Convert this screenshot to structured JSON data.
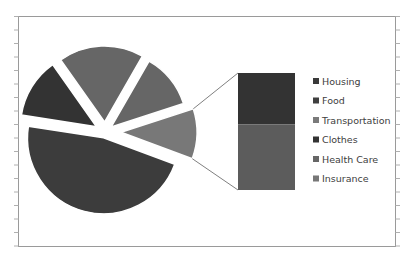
{
  "chart_data": {
    "type": "pie",
    "subtype": "bar-of-pie",
    "title": "",
    "legend_position": "right",
    "legend": [
      "Housing",
      "Food",
      "Transportation",
      "Clothes",
      "Health Care",
      "Insurance"
    ],
    "pie_slices": [
      {
        "label": "Other",
        "value": 10,
        "color": "#787878",
        "members": [
          "Health Care",
          "Insurance"
        ]
      },
      {
        "label": "Housing",
        "value": 44,
        "color": "#3c3c3c"
      },
      {
        "label": "Food",
        "value": 12,
        "color": "#333333"
      },
      {
        "label": "Transportation",
        "value": 17,
        "color": "#666666"
      },
      {
        "label": "Clothes",
        "value": 11,
        "color": "#666666"
      }
    ],
    "bar_segments": [
      {
        "label": "Health Care",
        "value": 4.4,
        "color": "#333333"
      },
      {
        "label": "Insurance",
        "value": 5.6,
        "color": "#5c5c5c"
      }
    ],
    "legend_colors": [
      "#3a3a3a",
      "#3f3f3f",
      "#7a7a7a",
      "#333333",
      "#666666",
      "#777777"
    ]
  }
}
